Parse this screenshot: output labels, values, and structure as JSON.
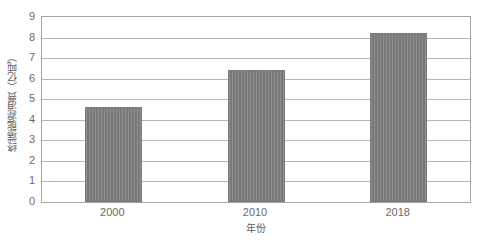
{
  "chart_data": {
    "type": "bar",
    "title": "",
    "categories": [
      "2000",
      "2010",
      "2018"
    ],
    "values": [
      4.6,
      6.4,
      8.2
    ],
    "series": [
      {
        "name": "终端能源消费",
        "values": [
          4.6,
          6.4,
          8.2
        ]
      }
    ],
    "xlabel": "年份",
    "ylabel": "终端能源消费（亿吨）",
    "ylim": [
      0,
      9
    ],
    "ytick_labels": [
      "0",
      "1",
      "2",
      "3",
      "4",
      "5",
      "6",
      "7",
      "8",
      "9"
    ],
    "ytick_values": [
      0,
      1,
      2,
      3,
      4,
      5,
      6,
      7,
      8,
      9
    ],
    "xtick_labels": [
      "2000",
      "2010",
      "2018"
    ],
    "grid": true,
    "grid_axis": "y",
    "legend": false,
    "legend_position": "none",
    "bar_color": "#808080",
    "grid_color": "#b5b5b5",
    "axis_color": "#a6a6a6",
    "text_color": "#6b6b6b",
    "background_color": "#ffffff"
  }
}
